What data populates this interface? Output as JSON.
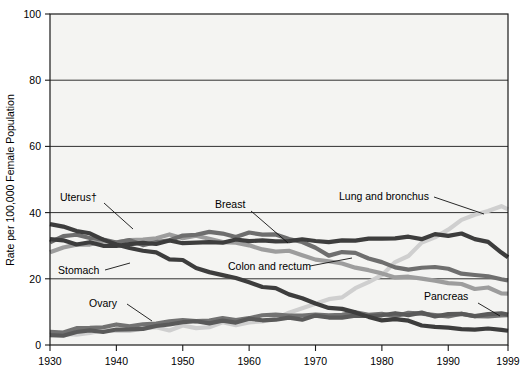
{
  "figure": {
    "axis_y_title": "Rate per 100,000 Female Population",
    "axis_x_title": "",
    "y_ticks": [
      "0",
      "20",
      "40",
      "60",
      "80",
      "100"
    ],
    "x_ticks": [
      "1930",
      "1940",
      "1950",
      "1960",
      "1970",
      "1980",
      "1990",
      "1999"
    ]
  },
  "labels": {
    "uterus": "Uterus†",
    "stomach": "Stomach",
    "ovary": "Ovary",
    "breast": "Breast",
    "colon": "Colon and rectum",
    "lung": "Lung and bronchus",
    "pancreas": "Pancreas"
  },
  "colors": {
    "plot_background": "#f4f4f2",
    "frame": "#1a1a1a",
    "uterus": "#6e6e6e",
    "stomach": "#3d3d3d",
    "ovary": "#727272",
    "breast": "#3d3d3d",
    "colon": "#9d9d9d",
    "lung": "#cfcfcf",
    "pancreas": "#5a5a5a"
  },
  "chart_data": {
    "type": "line",
    "title": "",
    "xlabel": "",
    "ylabel": "Rate per 100,000 Female Population",
    "xlim": [
      1930,
      1999
    ],
    "ylim": [
      0,
      100
    ],
    "grid": true,
    "legend": "inline-annotations",
    "x": [
      1930,
      1932,
      1934,
      1936,
      1938,
      1940,
      1942,
      1944,
      1946,
      1948,
      1950,
      1952,
      1954,
      1956,
      1958,
      1960,
      1962,
      1964,
      1966,
      1968,
      1970,
      1972,
      1974,
      1976,
      1978,
      1980,
      1982,
      1984,
      1986,
      1988,
      1990,
      1992,
      1994,
      1996,
      1998,
      1999
    ],
    "series": [
      {
        "name": "Uterus†",
        "color": "#6e6e6e",
        "values": [
          31.0,
          32.5,
          33.5,
          33.0,
          32.0,
          31.5,
          31.0,
          30.5,
          31.0,
          31.5,
          32.5,
          33.0,
          33.5,
          34.0,
          33.0,
          34.0,
          33.5,
          33.0,
          32.0,
          30.5,
          29.0,
          27.0,
          27.5,
          28.0,
          26.0,
          24.5,
          23.5,
          23.0,
          23.0,
          23.0,
          22.5,
          22.0,
          21.5,
          21.0,
          20.5,
          19.5
        ]
      },
      {
        "name": "Stomach",
        "color": "#3d3d3d",
        "values": [
          36.5,
          35.5,
          34.5,
          33.5,
          32.5,
          31.0,
          30.0,
          29.0,
          28.0,
          26.5,
          25.0,
          23.5,
          22.5,
          21.5,
          20.5,
          19.0,
          17.5,
          16.5,
          15.0,
          14.0,
          13.0,
          11.5,
          10.5,
          9.5,
          8.5,
          8.0,
          7.5,
          7.0,
          6.5,
          6.0,
          5.5,
          5.2,
          5.0,
          4.8,
          4.5,
          4.3
        ]
      },
      {
        "name": "Ovary",
        "color": "#727272",
        "values": [
          4.0,
          4.3,
          4.6,
          5.0,
          5.2,
          5.6,
          6.0,
          6.3,
          6.6,
          7.0,
          7.3,
          7.6,
          7.8,
          8.0,
          8.2,
          8.4,
          8.6,
          8.8,
          9.0,
          9.1,
          9.2,
          9.3,
          9.4,
          9.4,
          9.4,
          9.3,
          9.3,
          9.2,
          9.2,
          9.1,
          9.1,
          9.0,
          9.0,
          9.0,
          9.0,
          9.0
        ]
      },
      {
        "name": "Breast",
        "color": "#3d3d3d",
        "values": [
          32.0,
          31.5,
          31.0,
          30.5,
          30.0,
          30.0,
          30.0,
          30.5,
          31.0,
          31.0,
          31.0,
          31.5,
          31.5,
          31.5,
          31.5,
          31.0,
          31.5,
          32.0,
          31.5,
          31.5,
          31.5,
          31.5,
          32.0,
          32.0,
          32.0,
          32.0,
          32.5,
          32.5,
          32.5,
          33.0,
          33.5,
          33.0,
          32.5,
          31.5,
          28.5,
          26.5
        ]
      },
      {
        "name": "Colon and rectum",
        "color": "#9d9d9d",
        "values": [
          28.0,
          29.0,
          30.0,
          31.0,
          31.5,
          31.5,
          31.5,
          32.0,
          32.5,
          33.0,
          32.5,
          32.5,
          32.0,
          31.5,
          31.0,
          30.0,
          29.0,
          28.5,
          28.0,
          27.0,
          26.0,
          25.0,
          24.5,
          23.5,
          22.5,
          22.0,
          21.0,
          20.5,
          20.0,
          19.5,
          19.0,
          18.5,
          17.5,
          17.0,
          16.0,
          15.5
        ]
      },
      {
        "name": "Lung and bronchus",
        "color": "#cfcfcf",
        "values": [
          3.0,
          3.2,
          3.4,
          3.6,
          3.8,
          4.0,
          4.2,
          4.5,
          4.8,
          5.0,
          5.2,
          5.5,
          5.8,
          6.2,
          6.6,
          7.0,
          7.8,
          8.6,
          9.5,
          10.5,
          12.0,
          13.5,
          15.0,
          17.0,
          19.0,
          21.5,
          24.5,
          27.5,
          30.5,
          33.0,
          35.5,
          37.5,
          39.0,
          40.0,
          41.5,
          41.0
        ]
      },
      {
        "name": "Pancreas",
        "color": "#5a5a5a",
        "values": [
          3.0,
          3.3,
          3.7,
          4.0,
          4.3,
          4.6,
          5.0,
          5.3,
          5.6,
          6.0,
          6.3,
          6.6,
          6.9,
          7.1,
          7.3,
          7.5,
          7.7,
          7.9,
          8.0,
          8.2,
          8.4,
          8.5,
          8.6,
          8.7,
          8.8,
          8.9,
          9.0,
          9.1,
          9.1,
          9.2,
          9.2,
          9.2,
          9.2,
          9.2,
          9.2,
          9.2
        ]
      }
    ]
  }
}
